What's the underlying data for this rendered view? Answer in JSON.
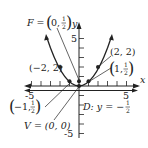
{
  "diagram": {
    "type": "parabola-graph",
    "equation": "x^2 = 2y",
    "axes": {
      "x_label": "x",
      "y_label": "y",
      "x_ticks": [
        "-5",
        "5"
      ],
      "y_ticks": [
        "5",
        "-5"
      ],
      "x_range": [
        -5,
        5
      ],
      "y_range": [
        -5,
        5
      ]
    },
    "labels": {
      "focus": "F = (0, 1/2)",
      "focus_prefix": "F =",
      "focus_x": "0,",
      "focus_num": "1",
      "focus_den": "2",
      "vertex": "V = (0, 0)",
      "directrix": "D: y = −1/2",
      "directrix_prefix": "D: y = −",
      "directrix_num": "1",
      "directrix_den": "2",
      "point_neg2": "(−2, 2)",
      "point_pos2": "(2, 2)",
      "point_neg1": "(−1, 1/2)",
      "point_neg1_x": "−1,",
      "point_pos1": "(1, 1/2)",
      "point_pos1_x": "1,",
      "half_num": "1",
      "half_den": "2"
    },
    "points": [
      {
        "name": "vertex",
        "x": 0,
        "y": 0
      },
      {
        "name": "focus",
        "x": 0,
        "y": 0.5
      },
      {
        "name": "p1",
        "x": -2,
        "y": 2
      },
      {
        "name": "p2",
        "x": 2,
        "y": 2
      },
      {
        "name": "p3",
        "x": -1,
        "y": 0.5
      },
      {
        "name": "p4",
        "x": 1,
        "y": 0.5
      }
    ],
    "colors": {
      "ink": "#222222",
      "background": "#ffffff"
    }
  }
}
